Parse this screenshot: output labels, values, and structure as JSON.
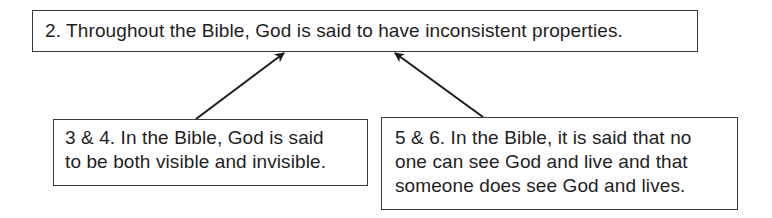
{
  "diagram": {
    "type": "argument-map",
    "conclusion": {
      "id": "2",
      "text": "2. Throughout the Bible, God is said to have inconsistent properties."
    },
    "premises": [
      {
        "id": "3-4",
        "lines": [
          "3 & 4. In the Bible, God is said",
          "to be both visible and invisible."
        ]
      },
      {
        "id": "5-6",
        "lines": [
          "5 & 6. In the Bible, it is said that no",
          "one can see God and live and that",
          "someone does see God and lives."
        ]
      }
    ],
    "edges": [
      {
        "from": "3-4",
        "to": "2",
        "style": "arrow"
      },
      {
        "from": "5-6",
        "to": "2",
        "style": "arrow"
      }
    ],
    "colors": {
      "stroke": "#3a3a3a",
      "text": "#1e1e1e",
      "background": "#ffffff"
    }
  }
}
